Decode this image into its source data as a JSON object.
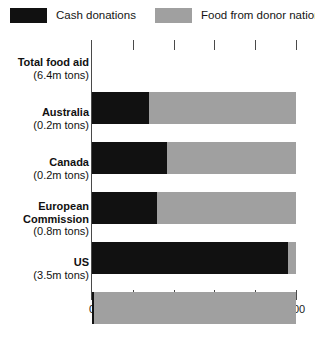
{
  "chart_data": {
    "type": "bar",
    "orientation": "horizontal",
    "stacked": true,
    "title": "",
    "subtitle": "",
    "xlabel": "",
    "ylabel": "",
    "xlim": [
      0,
      100
    ],
    "xticks": [
      0,
      20,
      40,
      60,
      80,
      100
    ],
    "xtick_labels": [
      "0",
      "20",
      "40",
      "60",
      "80",
      "100"
    ],
    "grid": false,
    "legend_position": "top",
    "categories": [
      "Total food aid",
      "Australia",
      "Canada",
      "European Commission",
      "US"
    ],
    "category_sublabels": [
      "(6.4m tons)",
      "(0.2m tons)",
      "(0.2m tons)",
      "(0.8m tons)",
      "(3.5m tons)"
    ],
    "series": [
      {
        "name": "Cash donations",
        "color": "#111111",
        "values": [
          28,
          37,
          32,
          96,
          1
        ]
      },
      {
        "name": "Food from donor nations",
        "color": "#a0a0a0",
        "values": [
          72,
          63,
          68,
          4,
          99
        ]
      }
    ],
    "rows": [
      {
        "label": "Total food aid",
        "sublabel": "(6.4m tons)",
        "cash": 28,
        "food": 72
      },
      {
        "label": "Australia",
        "sublabel": "(0.2m tons)",
        "cash": 37,
        "food": 63
      },
      {
        "label": "Canada",
        "sublabel": "(0.2m tons)",
        "cash": 32,
        "food": 68
      },
      {
        "label": "European Commission",
        "sublabel": "(0.8m tons)",
        "cash": 96,
        "food": 4
      },
      {
        "label": "US",
        "sublabel": "(3.5m tons)",
        "cash": 1,
        "food": 99
      }
    ]
  },
  "legend": {
    "cash_label": "Cash donations",
    "food_label": "Food from donor nations",
    "cash_color": "#111111",
    "food_color": "#a0a0a0"
  },
  "axis": {
    "tick_0": "0",
    "tick_1": "20",
    "tick_2": "40",
    "tick_3": "60",
    "tick_4": "80",
    "tick_5": "100"
  },
  "rows": {
    "r0": {
      "name": "Total food aid",
      "sub": "(6.4m tons)"
    },
    "r1": {
      "name": "Australia",
      "sub": "(0.2m tons)"
    },
    "r2": {
      "name": "Canada",
      "sub": "(0.2m tons)"
    },
    "r3a": {
      "name": "European",
      "name2": "Commission",
      "sub": "(0.8m tons)"
    },
    "r4": {
      "name": "US",
      "sub": "(3.5m tons)"
    }
  }
}
